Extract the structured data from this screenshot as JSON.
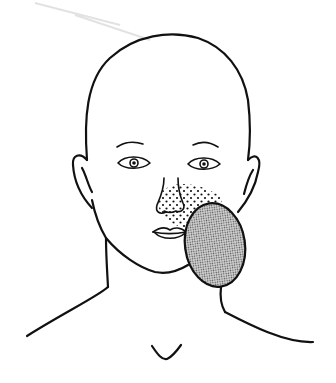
{
  "figure": {
    "description": "Line drawing of a child's head, neck and shoulders showing a shaded oval lesion over the left lower cheek/jaw area with stippled extension toward the nose and upper lip",
    "regions": [
      {
        "name": "lesion",
        "style": "dense-stipple",
        "location": "left lower cheek over jaw angle"
      },
      {
        "name": "stippled-area",
        "style": "sparse-stipple",
        "location": "nasal side and upper lip toward lesion"
      }
    ],
    "colors": {
      "line": "#111111",
      "lesion_fill": "#9a9a9a",
      "background": "#ffffff"
    }
  }
}
